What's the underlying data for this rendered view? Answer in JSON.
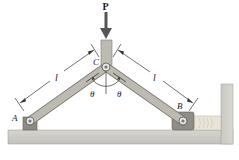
{
  "diagram": {
    "type": "mechanism",
    "labels": {
      "force": "P",
      "point_a": "A",
      "point_b": "B",
      "point_c": "C",
      "length_left": "l",
      "length_right": "l",
      "angle_left": "θ",
      "angle_right": "θ"
    },
    "colors": {
      "link": "#b8b6ad",
      "link_edge": "#7a7870",
      "ground": "#c9c8c2",
      "ground_edge": "#8e8d88",
      "support": "#8a8880",
      "arrow": "#555555",
      "slider_wood": "#e6e3d6",
      "dim_line": "#333333"
    }
  }
}
